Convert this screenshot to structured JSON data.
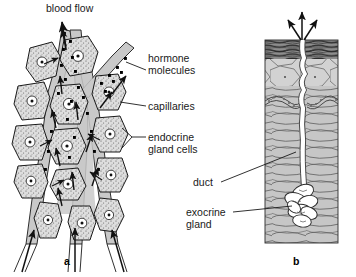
{
  "figure": {
    "panels": [
      {
        "id": "a",
        "letter": "a",
        "name": "endocrine-gland-panel",
        "description": "Endocrine gland cells surrounding capillaries with hormone molecules entering the blood"
      },
      {
        "id": "b",
        "letter": "b",
        "name": "exocrine-gland-panel",
        "description": "Exocrine gland in the dermis with a duct opening onto the skin surface"
      }
    ],
    "labels": {
      "blood_flow": "blood flow",
      "hormone_molecules_line1": "hormone",
      "hormone_molecules_line2": "molecules",
      "capillaries": "capillaries",
      "endocrine_gland_cells_line1": "endocrine",
      "endocrine_gland_cells_line2": "gland cells",
      "duct": "duct",
      "exocrine_gland_line1": "exocrine",
      "exocrine_gland_line2": "gland"
    },
    "colors": {
      "background": "#ffffff",
      "ink": "#1a1a1a",
      "cell_fill": "#d9d9d9",
      "capillary_fill": "#c9c9c9",
      "stratum_corneum": "#4d4d4d",
      "epidermis_fill": "#cfcfcf",
      "dermis_fill": "#c4c4c4",
      "duct_fill": "#ffffff",
      "molecule": "#000000"
    }
  }
}
